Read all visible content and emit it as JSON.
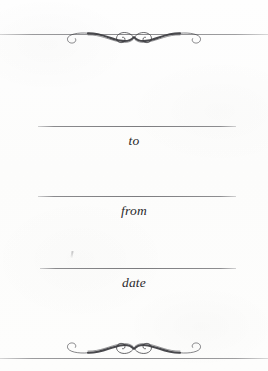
{
  "card": {
    "type": "gift-tag",
    "orientation": "portrait",
    "width": 268,
    "height": 371,
    "background_color": "#fdfdfc",
    "ink_color": "#2a2a2c",
    "rule_color": "#58585c"
  },
  "ornaments": {
    "top": {
      "name": "calligraphic-flourish",
      "description": "symmetric double-spiral filigree centered on the top rule"
    },
    "bottom": {
      "name": "calligraphic-flourish",
      "description": "vertically mirrored double-spiral filigree above the bottom rule"
    }
  },
  "rules": {
    "top_edge": "",
    "bottom_edge": ""
  },
  "fields": [
    {
      "id": "to",
      "label": "to",
      "value": "",
      "placeholder": ""
    },
    {
      "id": "from",
      "label": "from",
      "value": "",
      "placeholder": ""
    },
    {
      "id": "date",
      "label": "date",
      "value": "",
      "placeholder": ""
    }
  ],
  "artifacts": {
    "speck": ""
  }
}
